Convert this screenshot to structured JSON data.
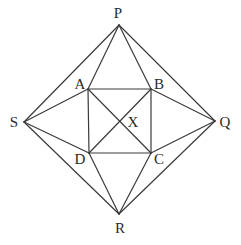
{
  "diagram": {
    "type": "geometry",
    "points": {
      "P": {
        "x": 119,
        "y": 25,
        "label": "P",
        "lx": 118,
        "ly": 13
      },
      "Q": {
        "x": 215,
        "y": 121,
        "label": "Q",
        "lx": 225,
        "ly": 122
      },
      "R": {
        "x": 119,
        "y": 214,
        "label": "R",
        "lx": 120,
        "ly": 228
      },
      "S": {
        "x": 24,
        "y": 122,
        "label": "S",
        "lx": 14,
        "ly": 122
      },
      "A": {
        "x": 88,
        "y": 89,
        "label": "A",
        "lx": 80,
        "ly": 84
      },
      "B": {
        "x": 151,
        "y": 89,
        "label": "B",
        "lx": 159,
        "ly": 84
      },
      "C": {
        "x": 151,
        "y": 153,
        "label": "C",
        "lx": 159,
        "ly": 159
      },
      "D": {
        "x": 89,
        "y": 153,
        "label": "D",
        "lx": 80,
        "ly": 159
      },
      "X": {
        "x": 120,
        "y": 121,
        "label": "X",
        "lx": 133,
        "ly": 122
      }
    },
    "segments": [
      [
        "P",
        "Q"
      ],
      [
        "Q",
        "R"
      ],
      [
        "R",
        "S"
      ],
      [
        "S",
        "P"
      ],
      [
        "A",
        "B"
      ],
      [
        "B",
        "C"
      ],
      [
        "C",
        "D"
      ],
      [
        "D",
        "A"
      ],
      [
        "A",
        "C"
      ],
      [
        "B",
        "D"
      ],
      [
        "P",
        "A"
      ],
      [
        "P",
        "B"
      ],
      [
        "Q",
        "B"
      ],
      [
        "Q",
        "C"
      ],
      [
        "R",
        "C"
      ],
      [
        "R",
        "D"
      ],
      [
        "S",
        "A"
      ],
      [
        "S",
        "D"
      ]
    ],
    "labels": [
      "P",
      "Q",
      "R",
      "S",
      "A",
      "B",
      "C",
      "D",
      "X"
    ],
    "colors": {
      "line": "#3a3a3a",
      "text": "#2a2a2a",
      "background": "#ffffff"
    }
  }
}
